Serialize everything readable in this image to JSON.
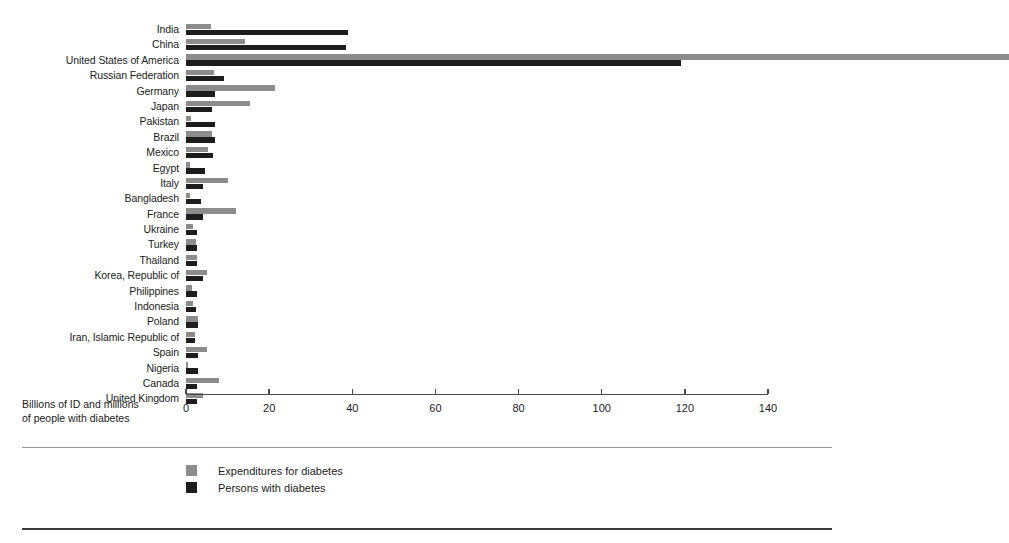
{
  "axis_title_line1": "Billions of ID and millions",
  "axis_title_line2": "of people with diabetes",
  "legend": {
    "items": [
      {
        "key": "expenditures",
        "label": "Expenditures for diabetes",
        "color": "#8c8c8c"
      },
      {
        "key": "persons",
        "label": "Persons with diabetes",
        "color": "#1d1d1d"
      }
    ]
  },
  "chart_data": {
    "type": "bar",
    "orientation": "horizontal",
    "grouped": true,
    "title": "",
    "xlabel": "Billions of ID and millions of people with diabetes",
    "ylabel": "",
    "xlim": [
      0,
      140
    ],
    "xticks": [
      0,
      20,
      40,
      60,
      80,
      100,
      120,
      140
    ],
    "grid": false,
    "legend_position": "bottom-left",
    "categories": [
      "India",
      "China",
      "United States of America",
      "Russian Federation",
      "Germany",
      "Japan",
      "Pakistan",
      "Brazil",
      "Mexico",
      "Egypt",
      "Italy",
      "Bangladesh",
      "France",
      "Ukraine",
      "Turkey",
      "Thailand",
      "Korea, Republic of",
      "Philippines",
      "Indonesia",
      "Poland",
      "Iran, Islamic Republic of",
      "Spain",
      "Nigeria",
      "Canada",
      "United Kingdom"
    ],
    "series": [
      {
        "name": "Expenditures for diabetes",
        "color": "#8c8c8c",
        "values": [
          6.0,
          14.2,
          198.0,
          6.8,
          21.4,
          15.4,
          1.2,
          6.2,
          5.2,
          1.0,
          10.2,
          1.0,
          12.0,
          1.6,
          2.4,
          2.6,
          5.0,
          1.4,
          1.6,
          3.0,
          2.2,
          5.0,
          0.6,
          8.0,
          4.2
        ]
      },
      {
        "name": "Persons with diabetes",
        "color": "#1d1d1d",
        "values": [
          39.0,
          38.4,
          119.0,
          9.2,
          7.0,
          6.2,
          7.0,
          7.0,
          6.6,
          4.6,
          4.2,
          3.6,
          4.0,
          2.6,
          2.6,
          2.6,
          4.0,
          2.6,
          2.4,
          3.0,
          2.2,
          3.0,
          3.0,
          2.6,
          2.6
        ]
      }
    ]
  }
}
